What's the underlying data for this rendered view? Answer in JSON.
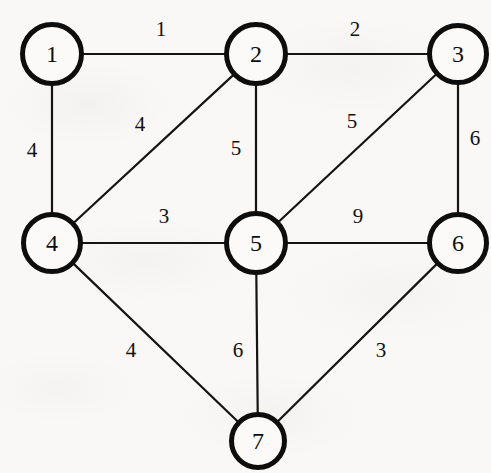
{
  "diagram": {
    "type": "weighted-graph",
    "canvas": {
      "width": 491,
      "height": 473
    },
    "style": {
      "background_color": "#f9f8f6",
      "node_fill": "#fbfaf8",
      "node_stroke": "#0d0d0d",
      "edge_stroke": "#141414",
      "label_color": "#111111",
      "node_stroke_width": 5,
      "edge_stroke_width": 2.2
    },
    "nodes": [
      {
        "id": "1",
        "label": "1",
        "cx": 52,
        "cy": 54,
        "r": 32,
        "font_size": 24
      },
      {
        "id": "2",
        "label": "2",
        "cx": 256,
        "cy": 54,
        "r": 32,
        "font_size": 24
      },
      {
        "id": "3",
        "label": "3",
        "cx": 458,
        "cy": 54,
        "r": 31,
        "font_size": 24
      },
      {
        "id": "4",
        "label": "4",
        "cx": 52,
        "cy": 243,
        "r": 31,
        "font_size": 24
      },
      {
        "id": "5",
        "label": "5",
        "cx": 256,
        "cy": 243,
        "r": 32,
        "font_size": 24
      },
      {
        "id": "6",
        "label": "6",
        "cx": 458,
        "cy": 243,
        "r": 31,
        "font_size": 24
      },
      {
        "id": "7",
        "label": "7",
        "cx": 258,
        "cy": 441,
        "r": 29,
        "font_size": 24
      }
    ],
    "edges": [
      {
        "id": "edge-1-2",
        "from": "1",
        "to": "2",
        "weight": "1",
        "label_x": 161,
        "label_y": 29,
        "font_size": 21
      },
      {
        "id": "edge-2-3",
        "from": "2",
        "to": "3",
        "weight": "2",
        "label_x": 355,
        "label_y": 29,
        "font_size": 21
      },
      {
        "id": "edge-1-4",
        "from": "1",
        "to": "4",
        "weight": "4",
        "label_x": 32,
        "label_y": 150,
        "font_size": 21
      },
      {
        "id": "edge-2-4",
        "from": "2",
        "to": "4",
        "weight": "4",
        "label_x": 140,
        "label_y": 124,
        "font_size": 21
      },
      {
        "id": "edge-2-5",
        "from": "2",
        "to": "5",
        "weight": "5",
        "label_x": 236,
        "label_y": 148,
        "font_size": 21
      },
      {
        "id": "edge-3-5",
        "from": "3",
        "to": "5",
        "weight": "5",
        "label_x": 352,
        "label_y": 121,
        "font_size": 21
      },
      {
        "id": "edge-3-6",
        "from": "3",
        "to": "6",
        "weight": "6",
        "label_x": 475,
        "label_y": 138,
        "font_size": 21
      },
      {
        "id": "edge-4-5",
        "from": "4",
        "to": "5",
        "weight": "3",
        "label_x": 164,
        "label_y": 216,
        "font_size": 21
      },
      {
        "id": "edge-5-6",
        "from": "5",
        "to": "6",
        "weight": "9",
        "label_x": 358,
        "label_y": 216,
        "font_size": 21
      },
      {
        "id": "edge-4-7",
        "from": "4",
        "to": "7",
        "weight": "4",
        "label_x": 131,
        "label_y": 350,
        "font_size": 21
      },
      {
        "id": "edge-5-7",
        "from": "5",
        "to": "7",
        "weight": "6",
        "label_x": 238,
        "label_y": 350,
        "font_size": 21
      },
      {
        "id": "edge-6-7",
        "from": "6",
        "to": "7",
        "weight": "3",
        "label_x": 381,
        "label_y": 350,
        "font_size": 21
      }
    ]
  }
}
